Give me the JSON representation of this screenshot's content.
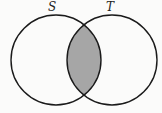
{
  "diagram": {
    "type": "venn",
    "sets": [
      {
        "label": "S",
        "cx": 56,
        "cy": 60,
        "r": 45
      },
      {
        "label": "T",
        "cx": 112,
        "cy": 60,
        "r": 45
      }
    ],
    "shaded_region": "S ∩ T",
    "colors": {
      "stroke": "#1a1a1a",
      "fill_shaded": "#a6a6a6",
      "background": "#fbfbfa"
    }
  }
}
